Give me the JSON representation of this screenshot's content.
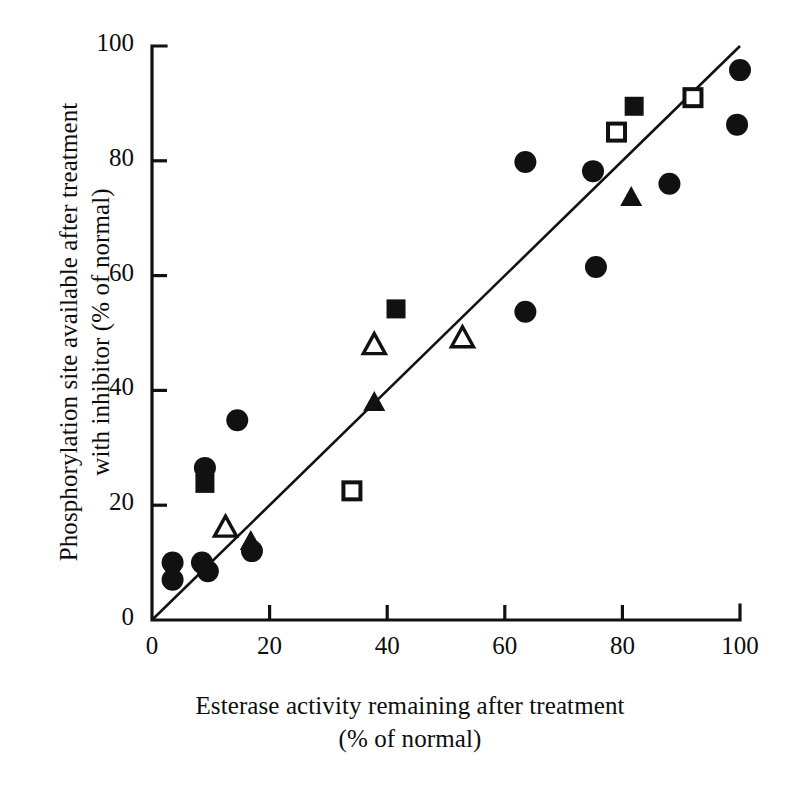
{
  "chart_data": {
    "type": "scatter",
    "title": "",
    "xlabel": "Esterase activity remaining after treatment\n(% of normal)",
    "ylabel": "Phosphorylation site available after treatment\nwith inhibitor (% of normal)",
    "xlim": [
      0,
      100
    ],
    "ylim": [
      0,
      100
    ],
    "xticks": [
      "0",
      "20",
      "40",
      "60",
      "80",
      "100"
    ],
    "xtick_values": [
      0,
      20,
      40,
      60,
      80,
      100
    ],
    "yticks": [
      "0",
      "20",
      "40",
      "60",
      "80",
      "100"
    ],
    "ytick_values": [
      0,
      20,
      40,
      60,
      80,
      100
    ],
    "grid": false,
    "legend": "none",
    "marker_color": "#111111",
    "line_color": "#111111",
    "axis_color": "#111111",
    "trendline": {
      "name": "line of identity",
      "x": [
        0,
        100
      ],
      "y": [
        0,
        100
      ]
    },
    "series": [
      {
        "name": "filled-circle",
        "marker": "filled-circle",
        "points": [
          {
            "x": 3.5,
            "y": 10.0
          },
          {
            "x": 3.5,
            "y": 7.0
          },
          {
            "x": 8.5,
            "y": 10.0
          },
          {
            "x": 9.5,
            "y": 8.5
          },
          {
            "x": 9.0,
            "y": 26.5
          },
          {
            "x": 14.5,
            "y": 34.8
          },
          {
            "x": 17.0,
            "y": 12.0
          },
          {
            "x": 63.5,
            "y": 79.8
          },
          {
            "x": 63.5,
            "y": 53.7
          },
          {
            "x": 75.0,
            "y": 78.2
          },
          {
            "x": 75.5,
            "y": 61.5
          },
          {
            "x": 88.0,
            "y": 76.0
          },
          {
            "x": 99.5,
            "y": 86.3
          },
          {
            "x": 100.0,
            "y": 95.8
          }
        ]
      },
      {
        "name": "filled-square",
        "marker": "filled-square",
        "points": [
          {
            "x": 9.0,
            "y": 23.8
          },
          {
            "x": 41.5,
            "y": 54.2
          },
          {
            "x": 82.0,
            "y": 89.5
          }
        ]
      },
      {
        "name": "open-square",
        "marker": "open-square",
        "points": [
          {
            "x": 34.0,
            "y": 22.5
          },
          {
            "x": 79.0,
            "y": 85.0
          },
          {
            "x": 92.0,
            "y": 91.0
          }
        ]
      },
      {
        "name": "filled-triangle",
        "marker": "filled-triangle",
        "points": [
          {
            "x": 16.8,
            "y": 13.6
          },
          {
            "x": 37.8,
            "y": 37.8
          },
          {
            "x": 81.5,
            "y": 73.5
          }
        ]
      },
      {
        "name": "open-triangle",
        "marker": "open-triangle",
        "points": [
          {
            "x": 12.5,
            "y": 16.0
          },
          {
            "x": 37.8,
            "y": 47.8
          },
          {
            "x": 52.8,
            "y": 49.0
          }
        ]
      }
    ]
  },
  "axes": {
    "x_title": "Esterase activity remaining after treatment\n(% of normal)",
    "y_title": "Phosphorylation site available after treatment\nwith inhibitor (% of normal)"
  },
  "top_cropped_text": ""
}
